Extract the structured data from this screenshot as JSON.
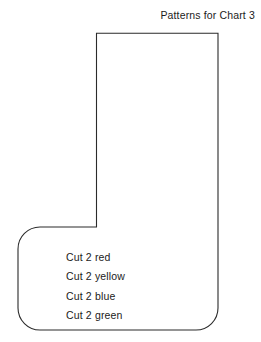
{
  "page": {
    "title": "Patterns for Chart 3",
    "background_color": "#ffffff",
    "width": 261,
    "height": 342
  },
  "figure": {
    "name": "stocking-pattern-outline",
    "stroke_color": "#2b2b2b",
    "fill_color": "none",
    "stroke_width": 1.1
  },
  "cut_labels": [
    {
      "text": "Cut 2 red"
    },
    {
      "text": "Cut 2 yellow"
    },
    {
      "text": "Cut 2 blue"
    },
    {
      "text": "Cut 2 green"
    }
  ]
}
